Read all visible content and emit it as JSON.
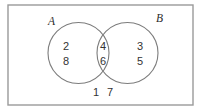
{
  "diagram": {
    "type": "venn-2-set",
    "title": "",
    "universe": {
      "name": "universal-set-rectangle",
      "x": 8,
      "y": 5,
      "width": 185,
      "height": 100,
      "stroke_color": "#9a9a9a"
    },
    "sets": [
      {
        "id": "A",
        "label": "A",
        "label_x": 48,
        "label_y": 25,
        "circle": {
          "cx": 78.5,
          "cy": 53,
          "r": 30.5
        },
        "only_elements": [
          "2",
          "8"
        ],
        "stroke_color": "#7d7d7d"
      },
      {
        "id": "B",
        "label": "B",
        "label_x": 156,
        "label_y": 22,
        "circle": {
          "cx": 127.5,
          "cy": 53,
          "r": 30.5
        },
        "only_elements": [
          "3",
          "5"
        ],
        "stroke_color": "#7d7d7d"
      }
    ],
    "regions": {
      "a_only": {
        "name": "region-a-only",
        "elements": [
          {
            "value": "2",
            "x": 66,
            "y": 50
          },
          {
            "value": "8",
            "x": 66,
            "y": 65
          }
        ]
      },
      "intersection": {
        "name": "region-a-intersect-b",
        "elements": [
          {
            "value": "4",
            "x": 103,
            "y": 50
          },
          {
            "value": "6",
            "x": 103,
            "y": 65
          }
        ]
      },
      "b_only": {
        "name": "region-b-only",
        "elements": [
          {
            "value": "3",
            "x": 140,
            "y": 50
          },
          {
            "value": "5",
            "x": 140,
            "y": 65
          }
        ]
      },
      "outside": {
        "name": "region-outside-both",
        "elements": [
          {
            "value": "1",
            "x": 96,
            "y": 96
          },
          {
            "value": "7",
            "x": 110,
            "y": 96
          }
        ]
      }
    },
    "element_text_color": "#333333",
    "background_color": "#ffffff"
  }
}
